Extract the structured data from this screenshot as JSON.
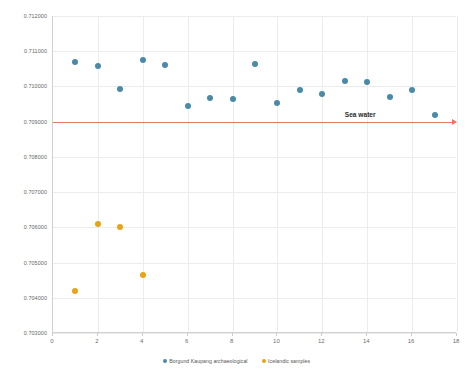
{
  "chart_data": {
    "type": "scatter",
    "title": "",
    "xlabel": "",
    "ylabel": "",
    "xlim": [
      0,
      18
    ],
    "ylim": [
      0.703,
      0.712
    ],
    "grid": true,
    "legend_position": "bottom",
    "xticks": [
      "0",
      "2",
      "4",
      "6",
      "8",
      "10",
      "12",
      "14",
      "16",
      "18"
    ],
    "xtick_values": [
      0,
      2,
      4,
      6,
      8,
      10,
      12,
      14,
      16,
      18
    ],
    "yticks": [
      "0.703000",
      "0.704000",
      "0.705000",
      "0.706000",
      "0.707000",
      "0.708000",
      "0.709000",
      "0.710000",
      "0.711000",
      "0.712000"
    ],
    "ytick_values": [
      0.703,
      0.704,
      0.705,
      0.706,
      0.707,
      0.708,
      0.709,
      0.71,
      0.711,
      0.712
    ],
    "series": [
      {
        "name": "Borgund Kaupang archaeological",
        "color": "#4a89a8",
        "marker": "circle",
        "x": [
          1,
          2,
          3,
          4,
          5,
          6,
          7,
          8,
          9,
          10,
          11,
          12,
          13,
          14,
          15,
          16,
          17
        ],
        "y": [
          0.7107,
          0.71058,
          0.70993,
          0.71076,
          0.71062,
          0.70945,
          0.70968,
          0.70963,
          0.71064,
          0.70952,
          0.7099,
          0.70979,
          0.71015,
          0.71012,
          0.70969,
          0.70989,
          0.7092
        ]
      },
      {
        "name": "Icelandic samples",
        "color": "#e8a317",
        "marker": "circle",
        "x": [
          1,
          2,
          3,
          4
        ],
        "y": [
          0.70418,
          0.7061,
          0.706,
          0.70466
        ]
      }
    ],
    "annotations": [
      {
        "name": "sea-water-reference-line",
        "label": "Sea water",
        "type": "hline",
        "y": 0.709,
        "color": "#e07a64",
        "arrow": "right",
        "label_x": 13.0
      }
    ]
  },
  "legend": {
    "items": [
      {
        "label": "Borgund Kaupang archaeological",
        "color": "#4a89a8"
      },
      {
        "label": "Icelandic samples",
        "color": "#e8a317"
      }
    ]
  }
}
